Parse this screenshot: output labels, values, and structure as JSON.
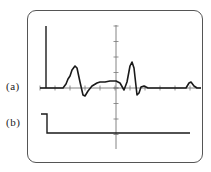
{
  "figure": {
    "labels": {
      "a": "(a)",
      "b": "(b)"
    },
    "colors": {
      "trace": "#1a1a1a",
      "grid": "#777777",
      "frame": "#555555",
      "background": "#ffffff"
    },
    "axes": {
      "horizontal_y": 88,
      "vertical_x": 116,
      "vertical_range": [
        25,
        149
      ],
      "horizontal_range": [
        40,
        201
      ],
      "tick_spacing": 15
    },
    "trace_a": {
      "description": "Evoked waveform with two biphasic spikes and a small late bump",
      "points": [
        [
          40,
          88
        ],
        [
          63,
          88
        ],
        [
          66,
          84
        ],
        [
          68,
          79
        ],
        [
          70,
          76
        ],
        [
          72,
          70
        ],
        [
          75,
          66
        ],
        [
          77,
          68
        ],
        [
          80,
          82
        ],
        [
          83,
          95
        ],
        [
          85,
          96
        ],
        [
          88,
          91
        ],
        [
          92,
          86
        ],
        [
          97,
          83
        ],
        [
          100,
          82
        ],
        [
          105,
          82
        ],
        [
          110,
          81
        ],
        [
          116,
          81
        ],
        [
          120,
          83
        ],
        [
          124,
          90
        ],
        [
          127,
          82
        ],
        [
          130,
          66
        ],
        [
          132,
          62
        ],
        [
          134,
          68
        ],
        [
          136,
          86
        ],
        [
          137,
          95
        ],
        [
          139,
          93
        ],
        [
          141,
          87
        ],
        [
          144,
          86
        ],
        [
          148,
          88
        ],
        [
          186,
          88
        ],
        [
          189,
          83
        ],
        [
          191,
          82
        ],
        [
          194,
          86
        ],
        [
          197,
          88
        ],
        [
          201,
          88
        ]
      ]
    },
    "trace_b": {
      "description": "Step stimulus marker",
      "points": [
        [
          41,
          114
        ],
        [
          47,
          114
        ],
        [
          47,
          133
        ],
        [
          190,
          133
        ]
      ]
    },
    "marker_a": {
      "x": 46,
      "y_top": 26,
      "y_bottom": 88
    }
  }
}
